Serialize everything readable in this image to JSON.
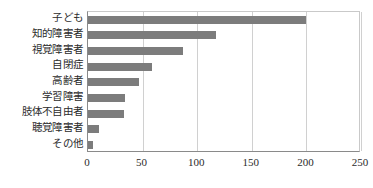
{
  "chart_data": {
    "type": "bar",
    "orientation": "horizontal",
    "title": "",
    "xlabel": "",
    "ylabel": "",
    "categories": [
      "子ども",
      "知的障害者",
      "視覚障害者",
      "自閉症",
      "高齢者",
      "学習障害",
      "肢体不自由者",
      "聴覚障害者",
      "その他"
    ],
    "values": [
      200,
      117,
      87,
      59,
      47,
      34,
      33,
      10,
      5
    ],
    "xlim": [
      0,
      250
    ],
    "xticks": [
      0,
      50,
      100,
      150,
      200,
      250
    ],
    "xtick_labels": [
      "0",
      "50",
      "100",
      "150",
      "200",
      "250"
    ],
    "grid": "vertical",
    "legend": "none",
    "bar_color": "#7c7c7c",
    "gridline_color": "#d0d0d0",
    "axis_color": "#8a8a8a",
    "background_color": "#ffffff"
  }
}
